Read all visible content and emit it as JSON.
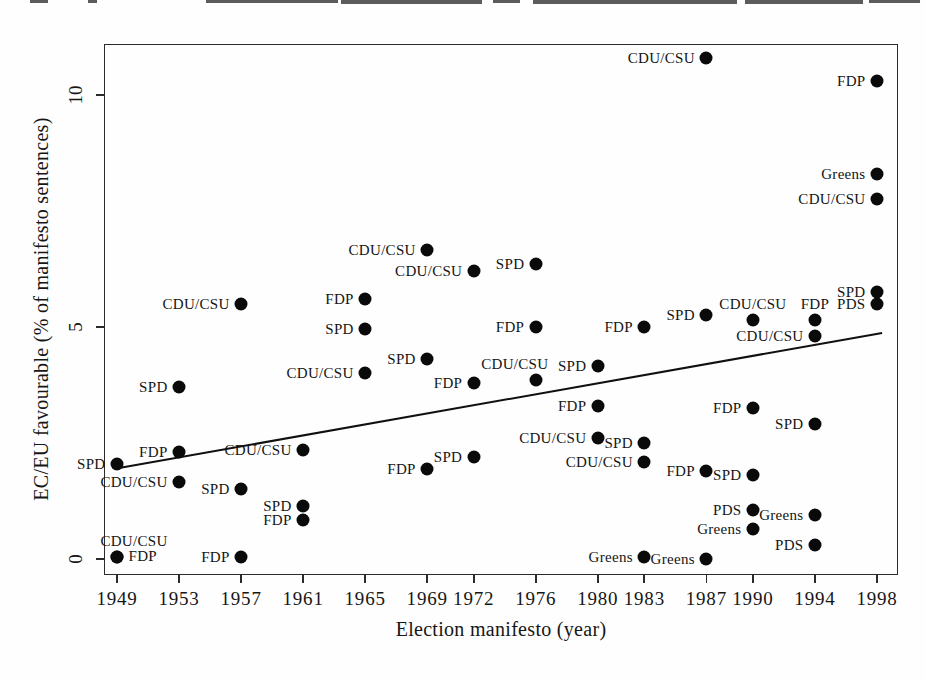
{
  "figure": {
    "xlabel": "Election manifesto (year)",
    "ylabel": "EC/EU favourable (% of manifesto sentences)"
  },
  "chart_data": {
    "type": "scatter",
    "title": "",
    "xlabel": "Election manifesto (year)",
    "ylabel": "EC/EU favourable (% of manifesto sentences)",
    "x_ticks": [
      1949,
      1953,
      1957,
      1961,
      1965,
      1969,
      1972,
      1976,
      1980,
      1983,
      1987,
      1990,
      1994,
      1998
    ],
    "y_ticks": [
      0,
      5,
      10
    ],
    "xlim": [
      1948.2,
      1999.4
    ],
    "ylim": [
      -0.35,
      11.1
    ],
    "grid": false,
    "legend": "none (each point labeled inline with party name)",
    "marker": "filled-circle",
    "parties": [
      "CDU/CSU",
      "SPD",
      "FDP",
      "Greens",
      "PDS"
    ],
    "trend_line": {
      "x1": 1949.1,
      "y1": 1.96,
      "x2": 1998.3,
      "y2": 4.87
    },
    "points": [
      {
        "party": "CDU/CSU",
        "year": 1949,
        "value": 0.05,
        "label_pos": "above-right"
      },
      {
        "party": "CDU/CSU",
        "year": 1953,
        "value": 1.65,
        "label_pos": "left"
      },
      {
        "party": "CDU/CSU",
        "year": 1957,
        "value": 5.5,
        "label_pos": "left"
      },
      {
        "party": "CDU/CSU",
        "year": 1961,
        "value": 2.35,
        "label_pos": "left"
      },
      {
        "party": "CDU/CSU",
        "year": 1965,
        "value": 4.0,
        "label_pos": "left"
      },
      {
        "party": "CDU/CSU",
        "year": 1969,
        "value": 6.65,
        "label_pos": "left"
      },
      {
        "party": "CDU/CSU",
        "year": 1972,
        "value": 6.2,
        "label_pos": "left"
      },
      {
        "party": "CDU/CSU",
        "year": 1976,
        "value": 3.85,
        "label_pos": "above-left"
      },
      {
        "party": "CDU/CSU",
        "year": 1980,
        "value": 2.6,
        "label_pos": "left"
      },
      {
        "party": "CDU/CSU",
        "year": 1983,
        "value": 2.1,
        "label_pos": "left"
      },
      {
        "party": "CDU/CSU",
        "year": 1987,
        "value": 10.8,
        "label_pos": "left"
      },
      {
        "party": "CDU/CSU",
        "year": 1990,
        "value": 5.15,
        "label_pos": "above"
      },
      {
        "party": "CDU/CSU",
        "year": 1994,
        "value": 4.8,
        "label_pos": "left"
      },
      {
        "party": "CDU/CSU",
        "year": 1998,
        "value": 7.75,
        "label_pos": "left"
      },
      {
        "party": "SPD",
        "year": 1949,
        "value": 2.05,
        "label_pos": "left"
      },
      {
        "party": "SPD",
        "year": 1953,
        "value": 3.7,
        "label_pos": "left"
      },
      {
        "party": "SPD",
        "year": 1957,
        "value": 1.5,
        "label_pos": "left"
      },
      {
        "party": "SPD",
        "year": 1961,
        "value": 1.15,
        "label_pos": "left"
      },
      {
        "party": "SPD",
        "year": 1965,
        "value": 4.95,
        "label_pos": "left"
      },
      {
        "party": "SPD",
        "year": 1969,
        "value": 4.3,
        "label_pos": "left"
      },
      {
        "party": "SPD",
        "year": 1972,
        "value": 2.2,
        "label_pos": "left"
      },
      {
        "party": "SPD",
        "year": 1976,
        "value": 6.35,
        "label_pos": "left"
      },
      {
        "party": "SPD",
        "year": 1980,
        "value": 4.15,
        "label_pos": "left"
      },
      {
        "party": "SPD",
        "year": 1983,
        "value": 2.5,
        "label_pos": "left"
      },
      {
        "party": "SPD",
        "year": 1987,
        "value": 5.25,
        "label_pos": "left"
      },
      {
        "party": "SPD",
        "year": 1990,
        "value": 1.8,
        "label_pos": "left"
      },
      {
        "party": "SPD",
        "year": 1994,
        "value": 2.9,
        "label_pos": "left"
      },
      {
        "party": "SPD",
        "year": 1998,
        "value": 5.75,
        "label_pos": "left"
      },
      {
        "party": "FDP",
        "year": 1949,
        "value": 0.05,
        "label_pos": "right"
      },
      {
        "party": "FDP",
        "year": 1953,
        "value": 2.3,
        "label_pos": "left"
      },
      {
        "party": "FDP",
        "year": 1957,
        "value": 0.05,
        "label_pos": "left"
      },
      {
        "party": "FDP",
        "year": 1961,
        "value": 0.85,
        "label_pos": "left"
      },
      {
        "party": "FDP",
        "year": 1965,
        "value": 5.6,
        "label_pos": "left"
      },
      {
        "party": "FDP",
        "year": 1969,
        "value": 1.95,
        "label_pos": "left"
      },
      {
        "party": "FDP",
        "year": 1972,
        "value": 3.8,
        "label_pos": "left"
      },
      {
        "party": "FDP",
        "year": 1976,
        "value": 5.0,
        "label_pos": "left"
      },
      {
        "party": "FDP",
        "year": 1980,
        "value": 3.3,
        "label_pos": "left"
      },
      {
        "party": "FDP",
        "year": 1983,
        "value": 5.0,
        "label_pos": "left"
      },
      {
        "party": "FDP",
        "year": 1987,
        "value": 1.9,
        "label_pos": "left"
      },
      {
        "party": "FDP",
        "year": 1990,
        "value": 3.25,
        "label_pos": "left"
      },
      {
        "party": "FDP",
        "year": 1994,
        "value": 5.15,
        "label_pos": "above"
      },
      {
        "party": "FDP",
        "year": 1998,
        "value": 10.3,
        "label_pos": "left"
      },
      {
        "party": "Greens",
        "year": 1983,
        "value": 0.05,
        "label_pos": "left"
      },
      {
        "party": "Greens",
        "year": 1987,
        "value": 0.0,
        "label_pos": "left"
      },
      {
        "party": "Greens",
        "year": 1990,
        "value": 0.65,
        "label_pos": "left"
      },
      {
        "party": "Greens",
        "year": 1994,
        "value": 0.95,
        "label_pos": "left"
      },
      {
        "party": "Greens",
        "year": 1998,
        "value": 8.3,
        "label_pos": "left"
      },
      {
        "party": "PDS",
        "year": 1990,
        "value": 1.05,
        "label_pos": "left"
      },
      {
        "party": "PDS",
        "year": 1994,
        "value": 0.3,
        "label_pos": "left"
      },
      {
        "party": "PDS",
        "year": 1998,
        "value": 5.5,
        "label_pos": "left"
      }
    ]
  }
}
